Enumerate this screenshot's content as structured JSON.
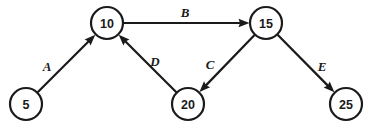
{
  "diagram": {
    "type": "directed-graph",
    "title": "",
    "canvas": {
      "width": 367,
      "height": 126,
      "background": "#ffffff"
    },
    "style": {
      "node_fill": "#ffffff",
      "stroke": "#1a1a1a",
      "node_radius": 16
    },
    "nodes": [
      {
        "id": "n5",
        "label": "5",
        "x": 26,
        "y": 104
      },
      {
        "id": "n10",
        "label": "10",
        "x": 107,
        "y": 23
      },
      {
        "id": "n15",
        "label": "15",
        "x": 266,
        "y": 23
      },
      {
        "id": "n20",
        "label": "20",
        "x": 188,
        "y": 104
      },
      {
        "id": "n25",
        "label": "25",
        "x": 346,
        "y": 104
      }
    ],
    "edges": [
      {
        "id": "eA",
        "label": "A",
        "from": "n5",
        "to": "n10",
        "label_x": 47,
        "label_y": 66,
        "directed": true
      },
      {
        "id": "eB",
        "label": "B",
        "from": "n10",
        "to": "n15",
        "label_x": 185,
        "label_y": 12,
        "directed": true
      },
      {
        "id": "eC",
        "label": "C",
        "from": "n15",
        "to": "n20",
        "label_x": 210,
        "label_y": 64,
        "directed": true
      },
      {
        "id": "eD",
        "label": "D",
        "from": "n20",
        "to": "n10",
        "label_x": 155,
        "label_y": 61,
        "directed": true
      },
      {
        "id": "eE",
        "label": "E",
        "from": "n15",
        "to": "n25",
        "label_x": 322,
        "label_y": 66,
        "directed": true
      }
    ]
  }
}
